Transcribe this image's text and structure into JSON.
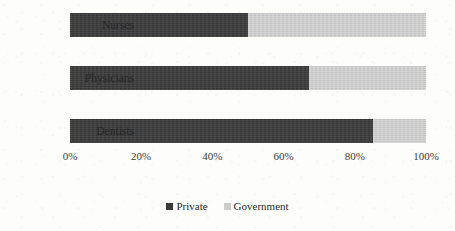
{
  "chart_data": {
    "type": "bar",
    "orientation": "horizontal",
    "stacked": true,
    "stack_mode": "percent",
    "title": "",
    "subtitle": "",
    "xlabel": "",
    "ylabel": "",
    "categories": [
      "Nurses",
      "Physicians",
      "Dentists"
    ],
    "series": [
      {
        "name": "Private",
        "color": "#3b3b3b",
        "values": [
          50,
          67,
          85
        ]
      },
      {
        "name": "Government",
        "color": "#cdcdcd",
        "values": [
          50,
          33,
          15
        ]
      }
    ],
    "xlim": [
      0,
      100
    ],
    "xticks": [
      0,
      20,
      40,
      60,
      80,
      100
    ],
    "xtick_labels": [
      "0%",
      "20%",
      "40%",
      "60%",
      "80%",
      "100%"
    ],
    "grid": false,
    "legend_position": "bottom",
    "annotations": []
  },
  "axis": {
    "ticks": [
      {
        "label": "0%",
        "value": 0
      },
      {
        "label": "20%",
        "value": 20
      },
      {
        "label": "40%",
        "value": 40
      },
      {
        "label": "60%",
        "value": 60
      },
      {
        "label": "80%",
        "value": 80
      },
      {
        "label": "100%",
        "value": 100
      }
    ]
  },
  "bars": [
    {
      "category": "Nurses",
      "private": 50,
      "government": 50,
      "top": 5
    },
    {
      "category": "Physicians",
      "private": 67,
      "government": 33,
      "top": 58
    },
    {
      "category": "Dentists",
      "private": 85,
      "government": 15,
      "top": 111
    }
  ],
  "legend": {
    "items": [
      {
        "label": "Private",
        "color": "#3b3b3b"
      },
      {
        "label": "Government",
        "color": "#cdcdcd"
      }
    ]
  }
}
